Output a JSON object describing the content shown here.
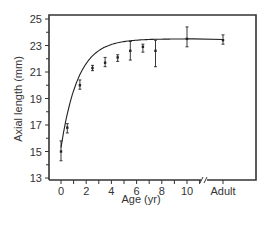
{
  "chart_data": {
    "type": "scatter",
    "title": "",
    "xlabel": "Age (yr)",
    "ylabel": "Axial length (mm)",
    "ylim": [
      13,
      25
    ],
    "xlim": [
      -0.5,
      11
    ],
    "grid": false,
    "legend": null,
    "x_tick_labels": [
      "0",
      "2",
      "4",
      "6",
      "8",
      "10",
      "Adult"
    ],
    "y_tick_labels": [
      "13",
      "15",
      "17",
      "19",
      "21",
      "23",
      "25"
    ],
    "axis_break": "between 10 and Adult",
    "series": [
      {
        "name": "Axial length",
        "x": [
          "0",
          "0.5",
          "1.5",
          "2.5",
          "3.5",
          "4.5",
          "5.5",
          "6.5",
          "7.5",
          "10",
          "Adult"
        ],
        "values": [
          15.0,
          16.8,
          20.0,
          21.3,
          21.7,
          22.1,
          22.6,
          22.9,
          22.6,
          23.5,
          23.4
        ],
        "error_low": [
          14.3,
          16.4,
          19.7,
          21.1,
          21.4,
          21.8,
          21.9,
          22.5,
          21.4,
          22.9,
          23.1
        ],
        "error_high": [
          15.8,
          17.1,
          20.4,
          21.5,
          22.1,
          22.3,
          23.3,
          23.1,
          23.4,
          24.4,
          23.8
        ]
      }
    ],
    "fit_curve": "saturating exponential from ~15.3 at age 0 to ~23.5 plateau"
  },
  "colors": {
    "line": "#222222",
    "axis": "#333333",
    "text": "#333333"
  }
}
